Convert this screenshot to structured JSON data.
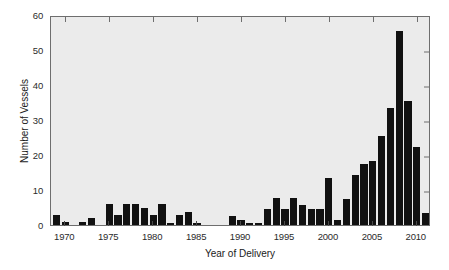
{
  "chart_data": {
    "type": "bar",
    "title": "",
    "xlabel": "Year of Delivery",
    "ylabel": "Number of Vessels",
    "xlim": [
      1968.3,
      1968.3
    ],
    "ylim": [
      0,
      60
    ],
    "xtick_labels": [
      "1970",
      "1975",
      "1980",
      "1985",
      "1990",
      "1995",
      "2000",
      "2005",
      "2010"
    ],
    "xticks": [
      1970,
      1975,
      1980,
      1985,
      1990,
      1995,
      2000,
      2005,
      2010
    ],
    "ytick_labels": [
      "0",
      "10",
      "20",
      "30",
      "40",
      "50",
      "60"
    ],
    "yticks": [
      0,
      10,
      20,
      30,
      40,
      50,
      60
    ],
    "grid": false,
    "legend": null,
    "bar_color": "#111111",
    "plot_background": "#ebebeb",
    "categories": [
      1969,
      1970,
      1971,
      1972,
      1973,
      1974,
      1975,
      1976,
      1977,
      1978,
      1979,
      1980,
      1981,
      1982,
      1983,
      1984,
      1985,
      1986,
      1987,
      1988,
      1989,
      1990,
      1991,
      1992,
      1993,
      1994,
      1995,
      1996,
      1997,
      1998,
      1999,
      2000,
      2001,
      2002,
      2003,
      2004,
      2005,
      2006,
      2007,
      2008,
      2009,
      2010,
      2011
    ],
    "values": [
      3,
      1,
      0,
      1,
      2,
      0,
      6,
      3,
      6,
      6,
      5,
      3,
      6,
      0.7,
      3,
      3.7,
      0.7,
      0,
      0,
      0,
      2.6,
      1.5,
      0.7,
      0.7,
      4.6,
      7.6,
      4.6,
      7.6,
      5.6,
      4.6,
      4.6,
      13.5,
      1.5,
      7.5,
      14.4,
      17.4,
      18.4,
      25.3,
      33.4,
      55.4,
      35.4,
      22.3,
      3.4
    ]
  },
  "axes": {
    "x_title": "Year of Delivery",
    "y_title": "Number of Vessels"
  }
}
